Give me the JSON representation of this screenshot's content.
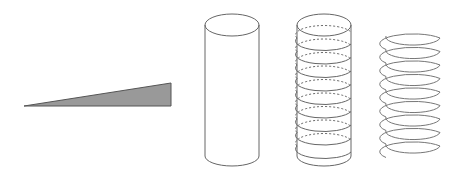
{
  "diagram": {
    "colors": {
      "stroke": "#555555",
      "wedge_fill": "#999999",
      "background": "#ffffff"
    },
    "figures": [
      {
        "id": "wedge",
        "label": ""
      },
      {
        "id": "cylinder",
        "label": ""
      },
      {
        "id": "wrapped-cylinder",
        "label": "",
        "turns": 9
      },
      {
        "id": "helix",
        "label": "",
        "turns": 9
      }
    ]
  }
}
